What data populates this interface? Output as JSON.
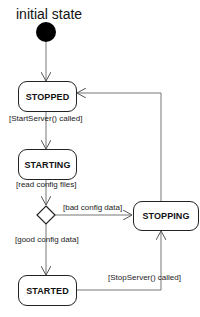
{
  "diagram": {
    "title": "initial state",
    "states": [
      {
        "id": "stopped",
        "label": "STOPPED"
      },
      {
        "id": "starting",
        "label": "STARTING"
      },
      {
        "id": "stopping",
        "label": "STOPPING"
      },
      {
        "id": "started",
        "label": "STARTED"
      }
    ],
    "transitions": [
      {
        "from": "initial",
        "to": "stopped",
        "label": ""
      },
      {
        "from": "stopped",
        "to": "starting",
        "label": "[StartServer() called]"
      },
      {
        "from": "starting",
        "to": "decision",
        "label": "[read config files]"
      },
      {
        "from": "decision",
        "to": "stopping",
        "label": "[bad config data]"
      },
      {
        "from": "decision",
        "to": "started",
        "label": "[good config data]"
      },
      {
        "from": "started",
        "to": "stopping",
        "label": "[StopServer() called]"
      },
      {
        "from": "stopping",
        "to": "stopped",
        "label": ""
      }
    ]
  }
}
